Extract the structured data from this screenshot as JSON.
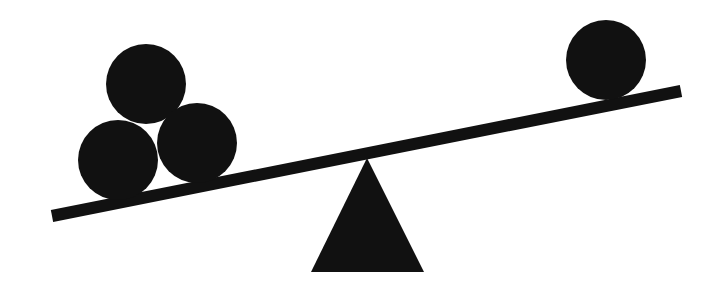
{
  "diagram": {
    "colors": {
      "background": "#ffffff",
      "fill": "#111111"
    },
    "beam": {
      "x1": 52,
      "y1": 216,
      "x2": 681,
      "y2": 91,
      "thickness": 12
    },
    "fulcrum": {
      "apex": [
        367,
        158
      ],
      "base_left": [
        311,
        272
      ],
      "base_right": [
        424,
        272
      ]
    },
    "balls": [
      {
        "id": "left-top",
        "cx": 146,
        "cy": 84,
        "r": 40
      },
      {
        "id": "left-bottom-left",
        "cx": 118,
        "cy": 160,
        "r": 40
      },
      {
        "id": "left-bottom-right",
        "cx": 197,
        "cy": 143,
        "r": 40
      },
      {
        "id": "right",
        "cx": 606,
        "cy": 60,
        "r": 40
      }
    ]
  }
}
